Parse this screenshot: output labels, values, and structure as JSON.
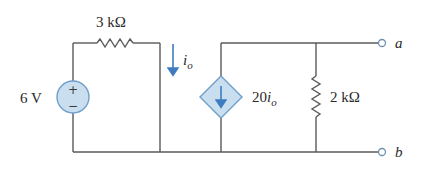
{
  "diagram": {
    "type": "circuit-schematic",
    "components": {
      "voltage_source": {
        "label": "6 V",
        "plus": "+",
        "minus": "−"
      },
      "resistor_series": {
        "label": "3 kΩ"
      },
      "current_label": {
        "symbol": "i",
        "subscript": "o"
      },
      "dependent_source": {
        "gain": "20",
        "symbol": "i",
        "subscript": "o"
      },
      "resistor_shunt": {
        "label": "2 kΩ"
      }
    },
    "terminals": {
      "a": "a",
      "b": "b"
    },
    "colors": {
      "wire": "#5a5a5a",
      "source_fill": "#c9dff0",
      "source_stroke": "#6f9fc9",
      "arrow": "#3d7cc0",
      "text": "#2a2a2a"
    }
  }
}
